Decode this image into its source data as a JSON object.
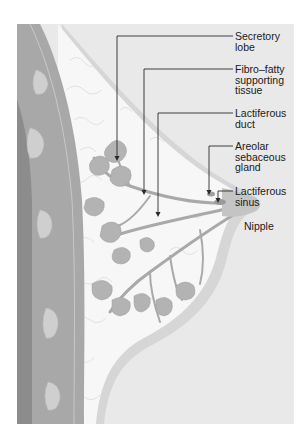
{
  "figure": {
    "colors": {
      "background": "#ffffff",
      "panel": "#e9e9e9",
      "skin_band": "#d6d6d6",
      "fat": "#f7f7f7",
      "chest_wall_dark": "#8c8c8c",
      "chest_wall_mid": "#a8a8a8",
      "rib": "#cfcfcf",
      "lobe": "#b3b3b3",
      "duct": "#a9a9a9",
      "leader_line": "#2a2a2a",
      "text": "#1a1a1a"
    }
  },
  "labels": [
    {
      "id": "secretory-lobe",
      "lines": [
        "Secretory",
        "lobe"
      ]
    },
    {
      "id": "fibro-fatty-tissue",
      "lines": [
        "Fibro–fatty",
        "supporting",
        "tissue"
      ]
    },
    {
      "id": "lactiferous-duct",
      "lines": [
        "Lactiferous",
        "duct"
      ]
    },
    {
      "id": "areolar-sebaceous-gland",
      "lines": [
        "Areolar",
        "sebaceous",
        "gland"
      ]
    },
    {
      "id": "lactiferous-sinus",
      "lines": [
        "Lactiferous",
        "sinus"
      ]
    },
    {
      "id": "nipple",
      "lines": [
        "Nipple"
      ]
    }
  ]
}
